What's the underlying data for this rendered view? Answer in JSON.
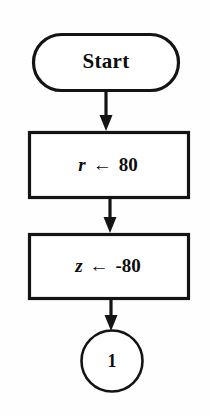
{
  "diagram": {
    "type": "flowchart",
    "background_color": "#fefefe",
    "stroke_color": "#141414",
    "fill_color": "#ffffff",
    "nodes": [
      {
        "id": "start",
        "shape": "terminator",
        "label": "Start",
        "x": 106,
        "y": 62,
        "width": 148,
        "height": 59
      },
      {
        "id": "assign-r",
        "shape": "process",
        "label": "r ← 80",
        "variable": "r",
        "operator": "←",
        "value": "80",
        "x": 108,
        "y": 165,
        "width": 161,
        "height": 68
      },
      {
        "id": "assign-z",
        "shape": "process",
        "label": "z ← -80",
        "variable": "z",
        "operator": "←",
        "value": "-80",
        "x": 108,
        "y": 266,
        "width": 161,
        "height": 67
      },
      {
        "id": "connector-1",
        "shape": "circle",
        "label": "1",
        "x": 112,
        "y": 361,
        "radius": 31
      }
    ],
    "edges": [
      {
        "id": "edge-start-to-r",
        "from": "start",
        "to": "assign-r",
        "label": ""
      },
      {
        "id": "edge-r-to-z",
        "from": "assign-r",
        "to": "assign-z",
        "label": ""
      },
      {
        "id": "edge-z-to-connector",
        "from": "assign-z",
        "to": "connector-1",
        "label": ""
      }
    ]
  }
}
